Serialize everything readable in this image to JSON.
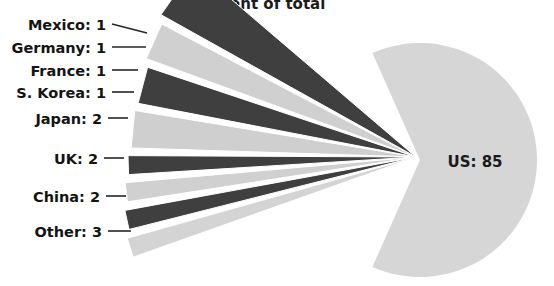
{
  "chart_data": {
    "type": "pie",
    "title": "Percent of total",
    "unit": "percent",
    "total": 100,
    "categories": [
      "US",
      "Other",
      "China",
      "UK",
      "Japan",
      "S. Korea",
      "France",
      "Germany",
      "Mexico"
    ],
    "values": [
      85,
      3,
      2,
      2,
      2,
      1,
      1,
      1,
      1
    ],
    "labels": [
      "US: 85",
      "Other: 3",
      "China: 2",
      "UK: 2",
      "Japan: 2",
      "S. Korea: 1",
      "France: 1",
      "Germany: 1",
      "Mexico: 1"
    ],
    "colors": [
      "#d6d6d6",
      "#3f3f3f",
      "#d0d0d0",
      "#3f3f3f",
      "#cfcfcf",
      "#3f3f3f",
      "#d0d0d0",
      "#3f3f3f",
      "#d4d4d4"
    ],
    "legend": "none",
    "grid": false,
    "xlabel": "",
    "ylabel": "",
    "slices": [
      {
        "name": "US",
        "value": 85,
        "label": "US: 85",
        "color": "#d6d6d6",
        "exploded": false,
        "label_position": "inside"
      },
      {
        "name": "Mexico",
        "value": 1,
        "label": "Mexico: 1",
        "color": "#d4d4d4",
        "exploded": true,
        "label_position": "outside"
      },
      {
        "name": "Germany",
        "value": 1,
        "label": "Germany: 1",
        "color": "#3f3f3f",
        "exploded": true,
        "label_position": "outside"
      },
      {
        "name": "France",
        "value": 1,
        "label": "France: 1",
        "color": "#d0d0d0",
        "exploded": true,
        "label_position": "outside"
      },
      {
        "name": "S. Korea",
        "value": 1,
        "label": "S. Korea: 1",
        "color": "#3f3f3f",
        "exploded": true,
        "label_position": "outside"
      },
      {
        "name": "Japan",
        "value": 2,
        "label": "Japan: 2",
        "color": "#cfcfcf",
        "exploded": true,
        "label_position": "outside"
      },
      {
        "name": "UK",
        "value": 2,
        "label": "UK: 2",
        "color": "#3f3f3f",
        "exploded": true,
        "label_position": "outside"
      },
      {
        "name": "China",
        "value": 2,
        "label": "China: 2",
        "color": "#d0d0d0",
        "exploded": true,
        "label_position": "outside"
      },
      {
        "name": "Other",
        "value": 3,
        "label": "Other: 3",
        "color": "#3f3f3f",
        "exploded": true,
        "label_position": "outside"
      }
    ]
  },
  "title": {
    "text": "Percent of total"
  },
  "center_label": {
    "text": "US: 85"
  },
  "callouts": [
    {
      "key": "mexico",
      "text": "Mexico: 1"
    },
    {
      "key": "germany",
      "text": "Germany: 1"
    },
    {
      "key": "france",
      "text": "France: 1"
    },
    {
      "key": "s-korea",
      "text": "S. Korea: 1"
    },
    {
      "key": "japan",
      "text": "Japan: 2"
    },
    {
      "key": "uk",
      "text": "UK: 2"
    },
    {
      "key": "china",
      "text": "China: 2"
    },
    {
      "key": "other",
      "text": "Other: 3"
    }
  ]
}
